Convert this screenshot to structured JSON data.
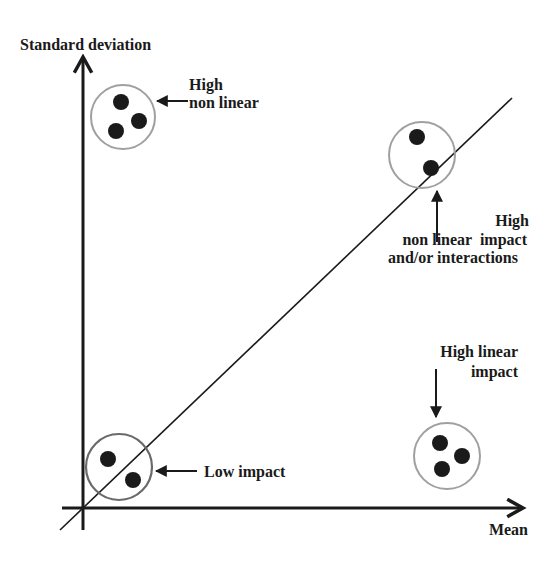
{
  "diagram": {
    "type": "morris-sensitivity-plot",
    "axes": {
      "y_label": "Standard deviation",
      "x_label": "Mean"
    },
    "colors": {
      "ink": "#1a1a1a",
      "circle_outline_light": "#a0a0a0",
      "circle_outline_dark": "#6a6a6a",
      "background": "#ffffff"
    },
    "groups": [
      {
        "id": "high-non-linear",
        "lines": [
          "High",
          "non linear"
        ],
        "points": 3,
        "circle": {
          "cx": 123,
          "cy": 117,
          "r": 32
        }
      },
      {
        "id": "high-non-linear-impact-interactions",
        "lines": [
          "High",
          "non linear  impact",
          "and/or interactions"
        ],
        "points": 2,
        "circle": {
          "cx": 422,
          "cy": 155,
          "r": 33
        }
      },
      {
        "id": "high-linear-impact",
        "lines": [
          "High linear",
          "impact"
        ],
        "points": 3,
        "circle": {
          "cx": 447,
          "cy": 456,
          "r": 33
        }
      },
      {
        "id": "low-impact",
        "lines": [
          "Low impact"
        ],
        "points": 2,
        "circle": {
          "cx": 119,
          "cy": 467,
          "r": 33
        }
      }
    ]
  }
}
